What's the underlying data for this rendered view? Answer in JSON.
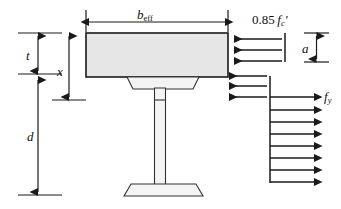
{
  "figure": {
    "width": 341,
    "height": 209,
    "background_color": "#ffffff",
    "line_color": "#1a1a1a",
    "slab_fill_color": "#e6e6e6",
    "beam_fill_color": "#f2f2f2"
  },
  "labels": {
    "b_eff": {
      "base": "b",
      "sub": "eff",
      "full": "b_eff",
      "meaning": "effective slab width"
    },
    "t": {
      "base": "t",
      "full": "t",
      "meaning": "slab thickness"
    },
    "x": {
      "base": "x",
      "full": "x",
      "meaning": "depth to neutral axis"
    },
    "d": {
      "base": "d",
      "full": "d",
      "meaning": "depth from slab soffit to beam bottom"
    },
    "a": {
      "base": "a",
      "full": "a",
      "meaning": "depth of compression stress block"
    },
    "f_y": {
      "base": "f",
      "sub": "y",
      "full": "f_y",
      "meaning": "steel yield stress"
    },
    "stress_concrete": {
      "coefficient": "0.85",
      "base": "f",
      "sub": "c",
      "prime": "′",
      "full": "0.85 f_c′",
      "meaning": "concrete compressive design stress"
    }
  },
  "geometry": {
    "slab": {
      "x": 86,
      "y": 33,
      "width": 142,
      "height": 44
    },
    "beam_top_flange": {
      "y": 77,
      "height": 12,
      "outer_left": 127,
      "outer_right": 199,
      "inner_left": 133,
      "inner_right": 193
    },
    "beam_web": {
      "left": 154,
      "right": 165,
      "top": 77,
      "bottom": 184
    },
    "beam_bottom_flange": {
      "y": 184,
      "height": 12,
      "outer_left": 124,
      "outer_right": 203,
      "inner_left": 131,
      "inner_right": 196
    }
  },
  "dimensions": [
    {
      "name": "b_eff",
      "orientation": "horizontal",
      "from": 88,
      "to": 226,
      "at": 22,
      "arrowheads": "both"
    },
    {
      "name": "t",
      "orientation": "vertical",
      "from": 33,
      "to": 74,
      "at": 38,
      "arrowheads": "both"
    },
    {
      "name": "x",
      "orientation": "vertical",
      "from": 33,
      "to": 100,
      "at": 69,
      "arrowheads": "both"
    },
    {
      "name": "d",
      "orientation": "vertical",
      "from": 78,
      "to": 195,
      "at": 38,
      "arrowheads": "both"
    },
    {
      "name": "a",
      "orientation": "vertical",
      "from": 33,
      "to": 62,
      "at": 316,
      "arrowheads": "both"
    }
  ],
  "stress_arrows": {
    "compression_block": {
      "label": "0.85 f_c′",
      "direction": "left",
      "count": 3,
      "tail_x": 285,
      "tip_x": 231,
      "rows_y": [
        39,
        50,
        61
      ]
    },
    "tension_upper": {
      "direction": "left",
      "count": 3,
      "tail_x": 270,
      "tip_x": 226,
      "rows_y": [
        75,
        86,
        97
      ]
    },
    "tension_lower": {
      "label": "f_y",
      "direction": "right",
      "count": 8,
      "tail_x": 270,
      "tip_x": 317,
      "rows_y": [
        97,
        110,
        122,
        134,
        146,
        158,
        170,
        182
      ]
    }
  }
}
